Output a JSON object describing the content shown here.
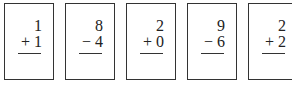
{
  "cards": [
    {
      "top": "1",
      "op": "+",
      "bottom": "1",
      "x": 4
    },
    {
      "top": "8",
      "op": "−",
      "bottom": "4",
      "x": 65
    },
    {
      "top": "2",
      "op": "+",
      "bottom": "0",
      "x": 126
    },
    {
      "top": "9",
      "op": "−",
      "bottom": "6",
      "x": 187
    },
    {
      "top": "2",
      "op": "+",
      "bottom": "2",
      "x": 248
    }
  ]
}
